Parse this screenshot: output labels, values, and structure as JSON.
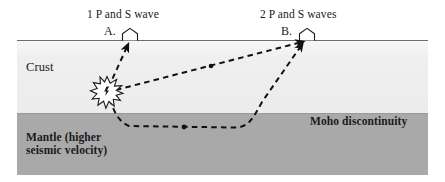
{
  "figure": {
    "type": "seismic-ray-path-cross-section",
    "title_text": null
  },
  "annotations": {
    "wave_label_1": "1 P and S wave",
    "wave_label_2": "2 P and S waves",
    "station_a_label": "A.",
    "station_b_label": "B.",
    "crust_label": "Crust",
    "mantle_label": "Mantle (higher\nseismic velocity)",
    "moho_label": "Moho discontinuity"
  },
  "layers": [
    {
      "name": "Crust",
      "color": "#efefef",
      "top_y": 41,
      "bottom_y": 114
    },
    {
      "name": "Mantle",
      "color": "#a9a9a9",
      "top_y": 114,
      "bottom_y": 175
    }
  ],
  "boundaries": [
    {
      "name": "ground-surface",
      "color": "#6d6d6d",
      "y": 40
    },
    {
      "name": "moho-discontinuity",
      "color": "#9a9a9a",
      "y": 113
    }
  ],
  "features": {
    "earthquake_focus": {
      "name": "earthquake-focus",
      "x": 107,
      "y": 92
    },
    "station_a": {
      "name": "seismic-station-a",
      "x": 130,
      "y": 40
    },
    "station_b": {
      "name": "seismic-station-b",
      "x": 307,
      "y": 40
    }
  },
  "ray_paths": [
    {
      "name": "direct-ray-to-a",
      "description": "1 P and S wave: direct ray from focus up to station A",
      "style": "dashed",
      "color": "#111111",
      "arrow_at_end": true
    },
    {
      "name": "direct-ray-to-b",
      "description": "2 P and S waves: direct ray from focus to station B",
      "style": "dashed",
      "color": "#111111",
      "arrow_at_end": true
    },
    {
      "name": "refracted-head-wave-to-b",
      "description": "Refracted ray travelling along the Moho then up to station B",
      "style": "dashed",
      "color": "#111111",
      "arrow_at_end": true
    }
  ],
  "colors": {
    "crust": "#efefef",
    "mantle": "#a9a9a9",
    "ray": "#111111",
    "surface_line": "#6d6d6d",
    "text": "#1a1a1a",
    "background": "#ffffff"
  }
}
